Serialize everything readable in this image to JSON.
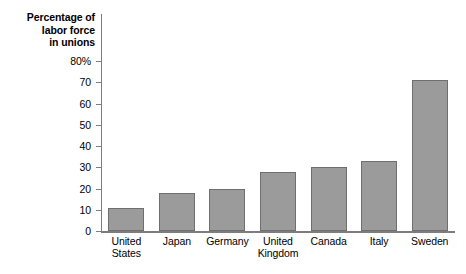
{
  "chart_data": {
    "type": "bar",
    "title": "",
    "ylabel": "Percentage of labor force in unions",
    "ylabel_lines": [
      "Percentage of",
      "labor force",
      "in unions"
    ],
    "xlabel": "",
    "categories": [
      "United States",
      "Japan",
      "Germany",
      "United Kingdom",
      "Canada",
      "Italy",
      "Sweden"
    ],
    "category_lines": [
      [
        "United",
        "States"
      ],
      [
        "Japan"
      ],
      [
        "Germany"
      ],
      [
        "United",
        "Kingdom"
      ],
      [
        "Canada"
      ],
      [
        "Italy"
      ],
      [
        "Sweden"
      ]
    ],
    "values": [
      11,
      18,
      20,
      28,
      30,
      33,
      71
    ],
    "ylim": [
      0,
      80
    ],
    "ytick_values": [
      0,
      10,
      20,
      30,
      40,
      50,
      60,
      70,
      80
    ],
    "ytick_labels": [
      "0",
      "10",
      "20",
      "30",
      "40",
      "50",
      "60",
      "70",
      "80%"
    ],
    "grid": false,
    "legend": false,
    "bar_color": "#9b9b9b",
    "bar_border_color": "#6f6f6f",
    "axis_color": "#7d7d7d",
    "background_color": "#ffffff"
  }
}
